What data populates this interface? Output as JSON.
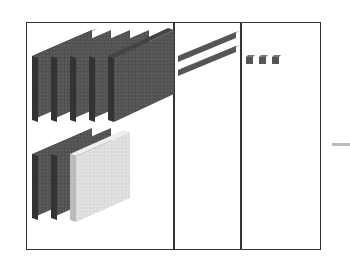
{
  "diagram": {
    "type": "base-ten-blocks",
    "columns": [
      {
        "name": "hundreds",
        "flats": 8,
        "flats_dark": 7,
        "flats_light": 1
      },
      {
        "name": "tens",
        "rods": 2
      },
      {
        "name": "ones",
        "units": 3
      }
    ],
    "colors": {
      "block_dark": "#555555",
      "block_light": "#dddddd",
      "border": "#333333",
      "dash": "#bbbbbb"
    }
  }
}
